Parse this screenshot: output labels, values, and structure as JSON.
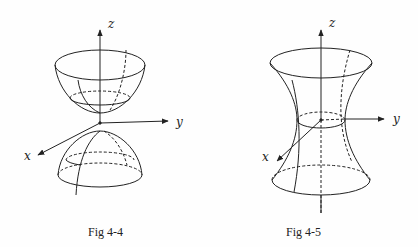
{
  "figures": [
    {
      "caption": "Fig 4-4",
      "surface": "hyperboloid-of-two-sheets",
      "axes": {
        "x": "x",
        "y": "y",
        "z": "z"
      }
    },
    {
      "caption": "Fig 4-5",
      "surface": "hyperboloid-of-one-sheet",
      "axes": {
        "x": "x",
        "y": "y",
        "z": "z"
      }
    }
  ],
  "colors": {
    "ink": "#222222",
    "background": "#fefefe"
  }
}
